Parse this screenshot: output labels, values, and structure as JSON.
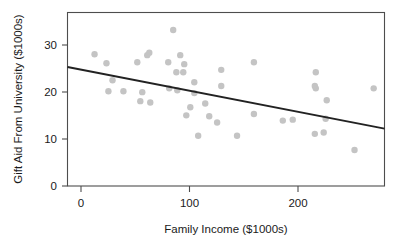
{
  "chart_data": {
    "type": "scatter",
    "title": "",
    "xlabel": "Family Income ($1000s)",
    "ylabel": "Gift Aid From University ($1000s)",
    "xlim": [
      -13,
      280
    ],
    "ylim": [
      -0.2,
      36.4
    ],
    "xticks": [
      0,
      100,
      200
    ],
    "xticklabels": [
      "0",
      "100",
      "200"
    ],
    "yticks": [
      0,
      10,
      20,
      30
    ],
    "yticklabels": [
      "0",
      "10",
      "20",
      "30"
    ],
    "grid": false,
    "legend": "none",
    "point_color": "#c4c4c4",
    "line_color": "#222222",
    "frame_color": "#4d4d4d",
    "points": [
      [
        12.0,
        27.6
      ],
      [
        23.0,
        25.7
      ],
      [
        51.5,
        25.9
      ],
      [
        60.7,
        27.4
      ],
      [
        62.6,
        27.9
      ],
      [
        28.6,
        22.1
      ],
      [
        24.8,
        19.8
      ],
      [
        38.7,
        19.8
      ],
      [
        56.1,
        19.6
      ],
      [
        84.7,
        32.7
      ],
      [
        91.2,
        27.4
      ],
      [
        80.1,
        25.9
      ],
      [
        94.9,
        25.5
      ],
      [
        87.6,
        23.8
      ],
      [
        94.0,
        23.8
      ],
      [
        104.2,
        21.7
      ],
      [
        129.1,
        24.3
      ],
      [
        129.1,
        20.9
      ],
      [
        81.0,
        20.4
      ],
      [
        88.5,
        20.0
      ],
      [
        104.2,
        19.4
      ],
      [
        159.3,
        25.9
      ],
      [
        216.5,
        23.8
      ],
      [
        216.5,
        20.4
      ],
      [
        270.0,
        20.4
      ],
      [
        215.6,
        20.9
      ],
      [
        54.3,
        17.7
      ],
      [
        63.5,
        17.4
      ],
      [
        100.5,
        16.4
      ],
      [
        96.8,
        14.7
      ],
      [
        114.3,
        17.2
      ],
      [
        118.0,
        14.5
      ],
      [
        125.3,
        13.2
      ],
      [
        107.8,
        10.4
      ],
      [
        143.7,
        10.4
      ],
      [
        159.3,
        15.0
      ],
      [
        186.0,
        13.6
      ],
      [
        195.2,
        13.8
      ],
      [
        225.6,
        14.0
      ],
      [
        223.8,
        11.1
      ],
      [
        252.3,
        7.4
      ],
      [
        215.6,
        10.8
      ],
      [
        226.6,
        17.9
      ]
    ],
    "fit_line": {
      "x0": -13,
      "y0": 24.9,
      "x1": 280,
      "y1": 11.9,
      "label": "linear fit"
    }
  }
}
